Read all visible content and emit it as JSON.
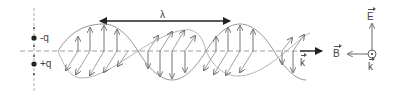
{
  "diagram": {
    "charges": {
      "negative_label": "-q",
      "positive_label": "+q"
    },
    "wavelength_label": "λ",
    "propagation_label": "k",
    "axes_inset": {
      "e_label": "E",
      "b_label": "B",
      "k_label": "k",
      "k_symbol": "⊙"
    },
    "colors": {
      "line": "#777777",
      "dark": "#222222",
      "text": "#444444"
    }
  }
}
